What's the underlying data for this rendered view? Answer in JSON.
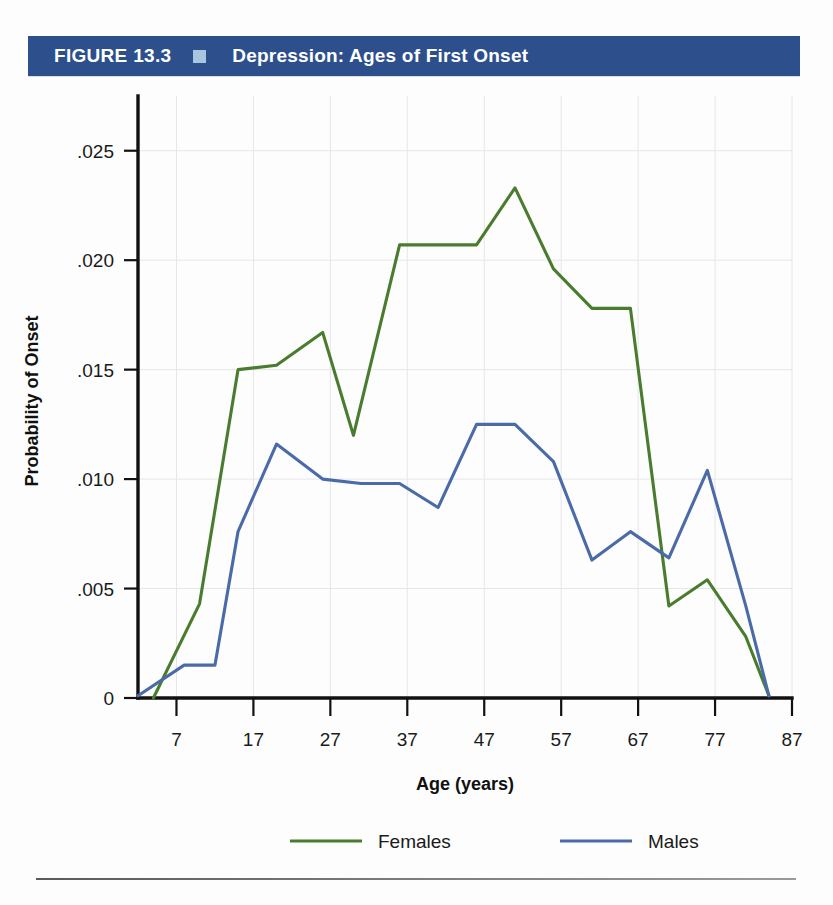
{
  "header": {
    "figure_number": "FIGURE 13.3",
    "marker_icon": "blue-square-icon",
    "marker_color": "#a9c6e0",
    "title": "Depression: Ages of First Onset",
    "band_color": "#2d4f8b"
  },
  "chart_data": {
    "type": "line",
    "title": "Depression: Ages of First Onset",
    "xlabel": "Age (years)",
    "ylabel": "Probability of Onset",
    "xlim": [
      2,
      87
    ],
    "ylim": [
      0,
      0.0275
    ],
    "xticks": [
      7,
      17,
      27,
      37,
      47,
      57,
      67,
      77,
      87
    ],
    "xtick_labels": [
      "7",
      "17",
      "27",
      "37",
      "47",
      "57",
      "67",
      "77",
      "87"
    ],
    "yticks": [
      0,
      0.005,
      0.01,
      0.015,
      0.02,
      0.025
    ],
    "ytick_labels": [
      "0",
      ".005",
      ".010",
      ".015",
      ".020",
      ".025"
    ],
    "grid": true,
    "legend_position": "bottom",
    "series": [
      {
        "name": "Females",
        "color": "#4a7c2f",
        "x": [
          4,
          10,
          15,
          20,
          26,
          30,
          36,
          41,
          46,
          51,
          56,
          61,
          66,
          71,
          76,
          81,
          84
        ],
        "values": [
          0.0,
          0.0043,
          0.015,
          0.0152,
          0.0167,
          0.012,
          0.0207,
          0.0207,
          0.0207,
          0.0233,
          0.0196,
          0.0178,
          0.0178,
          0.0042,
          0.0054,
          0.0028,
          0.0001
        ]
      },
      {
        "name": "Males",
        "color": "#4a6ba8",
        "x": [
          2,
          8,
          12,
          15,
          20,
          26,
          31,
          36,
          41,
          46,
          51,
          56,
          61,
          66,
          71,
          76,
          81,
          84
        ],
        "values": [
          0.0001,
          0.0015,
          0.0015,
          0.0076,
          0.0116,
          0.01,
          0.0098,
          0.0098,
          0.0087,
          0.0125,
          0.0125,
          0.0108,
          0.0063,
          0.0076,
          0.0064,
          0.0104,
          0.0042,
          0.0001
        ]
      }
    ]
  }
}
